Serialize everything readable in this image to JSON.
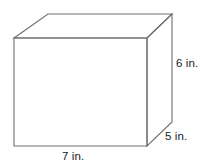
{
  "figure": {
    "name": "rectangular-prism",
    "shape_type": "rectangular prism",
    "background_color": "#ffffff",
    "edge_color": "#6e6e6e",
    "face_color": "#ffffff",
    "text_color": "#1b1b1b"
  },
  "labels": {
    "height": "6 in.",
    "depth": "5 in.",
    "width": "7 in."
  },
  "dimensions": {
    "width_value": 7,
    "height_value": 6,
    "depth_value": 5,
    "unit": "in."
  },
  "geometry": {
    "front_top_left": "14,38",
    "front_top_right": "147,38",
    "front_bottom_right": "147,146",
    "front_bottom_left": "14,146",
    "back_top_left": "48,14",
    "back_top_right": "172,14",
    "back_bottom_right": "172,122",
    "front_face": "14,38 147,38 147,146 14,146",
    "top_face": "14,38 48,14 172,14 147,38",
    "right_face": "147,38 172,14 172,122 147,146"
  }
}
